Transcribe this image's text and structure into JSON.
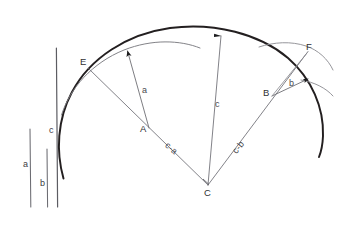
{
  "figure": {
    "type": "geometric-construction",
    "background_color": "#ffffff",
    "ink_color": "#2f2f33",
    "thin_ink_color": "#8a8a90"
  },
  "reference_segments": {
    "items": [
      {
        "id": "a",
        "label": "a",
        "label_x": 24,
        "label_y": 161,
        "x": 30,
        "y_top": 129,
        "y_bottom": 207,
        "length_px": 78
      },
      {
        "id": "b",
        "label": "b",
        "label_x": 41,
        "label_y": 180,
        "x": 47,
        "y_top": 149,
        "y_bottom": 207,
        "length_px": 58
      },
      {
        "id": "c",
        "label": "c",
        "label_x": 50,
        "label_y": 128,
        "x": 57,
        "y_top": 48,
        "y_bottom": 207,
        "length_px": 159
      }
    ]
  },
  "points": [
    {
      "id": "E",
      "label": "E",
      "x": 88,
      "y": 68,
      "label_x": 80,
      "label_y": 60
    },
    {
      "id": "A",
      "label": "A",
      "x": 148,
      "y": 131,
      "label_x": 142,
      "label_y": 128
    },
    {
      "id": "C",
      "label": "C",
      "x": 208,
      "y": 185,
      "label_x": 204,
      "label_y": 188
    },
    {
      "id": "B",
      "label": "B",
      "x": 272,
      "y": 96,
      "label_x": 264,
      "label_y": 90
    },
    {
      "id": "F",
      "label": "F",
      "x": 308,
      "y": 51,
      "label_x": 307,
      "label_y": 44
    }
  ],
  "segment_labels": [
    {
      "id": "a-arrow",
      "label": "a",
      "x": 143,
      "y": 90,
      "rotate": 0
    },
    {
      "id": "c-radius",
      "label": "c",
      "x": 216,
      "y": 105,
      "rotate": 0
    },
    {
      "id": "b-arrow",
      "label": "b",
      "x": 290,
      "y": 83,
      "rotate": 0
    },
    {
      "id": "c-minus-a",
      "label": "c-a",
      "x": 170,
      "y": 145,
      "rotate": 40
    },
    {
      "id": "c-minus-b",
      "label": "c-b",
      "x": 232,
      "y": 142,
      "rotate": -52
    }
  ],
  "arcs": {
    "main_outer": {
      "center_x": 208,
      "center_y": 185,
      "radius": 150,
      "stroke_width": 1.9,
      "color": "#231f20"
    },
    "inner_a": {
      "stroke_width": 0.9,
      "color": "#6d6d73"
    },
    "inner_b": {
      "stroke_width": 0.9,
      "color": "#8a8a90"
    },
    "outer_b": {
      "stroke_width": 0.9,
      "color": "#8a8a90"
    }
  },
  "rays": [
    {
      "id": "ray-C-E",
      "from": "C",
      "to": "E"
    },
    {
      "id": "ray-C-top",
      "from": "C",
      "to": "apex",
      "label": "c"
    },
    {
      "id": "ray-C-F",
      "from": "C",
      "to": "F"
    },
    {
      "id": "ray-A-arc",
      "from": "A",
      "to": "inner-arc",
      "label": "a",
      "arrow": true
    },
    {
      "id": "ray-B-arc",
      "from": "B",
      "to": "outer-arc",
      "label": "b",
      "arrow": true
    }
  ]
}
